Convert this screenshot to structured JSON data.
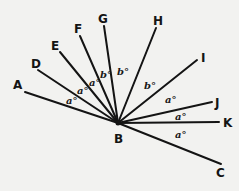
{
  "diagram": {
    "vertex": {
      "name": "B",
      "x": 118,
      "y": 123,
      "label_x": 114,
      "label_y": 143
    },
    "rays": [
      {
        "name": "A",
        "x2": 25,
        "y2": 92,
        "label_x": 13,
        "label_y": 89
      },
      {
        "name": "D",
        "x2": 38,
        "y2": 70,
        "label_x": 31,
        "label_y": 68
      },
      {
        "name": "E",
        "x2": 60,
        "y2": 52,
        "label_x": 51,
        "label_y": 50
      },
      {
        "name": "F",
        "x2": 80,
        "y2": 36,
        "label_x": 74,
        "label_y": 33
      },
      {
        "name": "G",
        "x2": 104,
        "y2": 26,
        "label_x": 98,
        "label_y": 23
      },
      {
        "name": "H",
        "x2": 156,
        "y2": 28,
        "label_x": 153,
        "label_y": 25
      },
      {
        "name": "I",
        "x2": 197,
        "y2": 60,
        "label_x": 201,
        "label_y": 62
      },
      {
        "name": "J",
        "x2": 212,
        "y2": 102,
        "label_x": 215,
        "label_y": 107
      },
      {
        "name": "K",
        "x2": 219,
        "y2": 122,
        "label_x": 223,
        "label_y": 127
      },
      {
        "name": "C",
        "x2": 221,
        "y2": 164,
        "label_x": 216,
        "label_y": 177
      }
    ],
    "angles": [
      {
        "between": "A-D",
        "label": "a°",
        "x": 66,
        "y": 104
      },
      {
        "between": "D-E",
        "label": "a°",
        "x": 77,
        "y": 94
      },
      {
        "between": "E-F",
        "label": "a°",
        "x": 89,
        "y": 86
      },
      {
        "between": "F-G",
        "label": "b°",
        "x": 100,
        "y": 78
      },
      {
        "between": "G-H",
        "label": "b°",
        "x": 117,
        "y": 75
      },
      {
        "between": "H-I",
        "label": "b°",
        "x": 144,
        "y": 89
      },
      {
        "between": "I-J",
        "label": "a°",
        "x": 165,
        "y": 103
      },
      {
        "between": "J-K",
        "label": "a°",
        "x": 175,
        "y": 120
      },
      {
        "between": "K-C",
        "label": "a°",
        "x": 175,
        "y": 138
      }
    ]
  }
}
